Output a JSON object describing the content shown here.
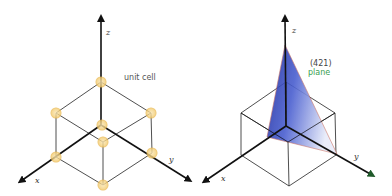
{
  "panels": [
    {
      "id": "unit-cell",
      "axes": {
        "x_label": "x",
        "y_label": "y",
        "z_label": "z"
      },
      "annotation": "unit cell",
      "atom_color": "#f0c060"
    },
    {
      "id": "miller-plane",
      "axes": {
        "x_label": "x",
        "y_label": "y",
        "z_label": "z"
      },
      "annotation_index": "(421)",
      "annotation_name": "plane",
      "plane_color": "#2f3fb0",
      "name_color": "#3aa050"
    }
  ]
}
